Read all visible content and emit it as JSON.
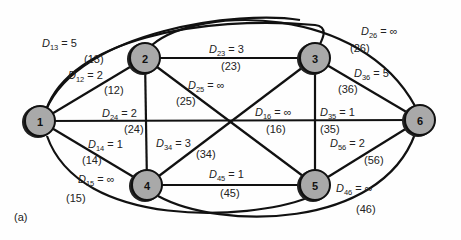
{
  "figure": {
    "panel_label": "(a)",
    "nodes": [
      {
        "id": "1",
        "label": "1",
        "x": 40,
        "y": 121
      },
      {
        "id": "2",
        "label": "2",
        "x": 145,
        "y": 58
      },
      {
        "id": "3",
        "label": "3",
        "x": 315,
        "y": 58
      },
      {
        "id": "4",
        "label": "4",
        "x": 147,
        "y": 185
      },
      {
        "id": "5",
        "label": "5",
        "x": 315,
        "y": 185
      },
      {
        "id": "6",
        "label": "6",
        "x": 420,
        "y": 120
      }
    ],
    "edges": [
      {
        "id": "13",
        "sub": "13",
        "value": "5",
        "paren": "(13)"
      },
      {
        "id": "12",
        "sub": "12",
        "value": "2",
        "paren": "(12)"
      },
      {
        "id": "24",
        "sub": "24",
        "value": "2",
        "paren": "(24)"
      },
      {
        "id": "14",
        "sub": "14",
        "value": "1",
        "paren": "(14)"
      },
      {
        "id": "15",
        "sub": "15",
        "value": "∞",
        "paren": "(15)"
      },
      {
        "id": "23",
        "sub": "23",
        "value": "3",
        "paren": "(23)"
      },
      {
        "id": "25",
        "sub": "25",
        "value": "∞",
        "paren": "(25)"
      },
      {
        "id": "34",
        "sub": "34",
        "value": "3",
        "paren": "(34)"
      },
      {
        "id": "45",
        "sub": "45",
        "value": "1",
        "paren": "(45)"
      },
      {
        "id": "16",
        "sub": "16",
        "value": "∞",
        "paren": "(16)"
      },
      {
        "id": "35",
        "sub": "35",
        "value": "1",
        "paren": "(35)"
      },
      {
        "id": "26",
        "sub": "26",
        "value": "∞",
        "paren": "(26)"
      },
      {
        "id": "36",
        "sub": "36",
        "value": "5",
        "paren": "(36)"
      },
      {
        "id": "56",
        "sub": "56",
        "value": "2",
        "paren": "(56)"
      },
      {
        "id": "46",
        "sub": "46",
        "value": "∞",
        "paren": "(46)"
      }
    ],
    "symbol": "D",
    "equals": "="
  }
}
